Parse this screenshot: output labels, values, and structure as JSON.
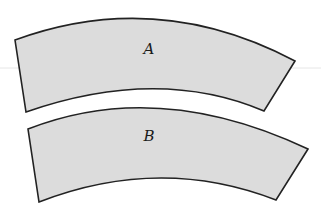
{
  "diagram": {
    "type": "annular-sector-pieces",
    "colors": {
      "fill": "#dcdcdc",
      "stroke": "#222222",
      "background": "#ffffff"
    },
    "shapes": [
      {
        "id": "A",
        "label": "A",
        "label_pos": [
          149,
          54
        ],
        "path": "M15,40 Q157,-12 295,61 L264,111 Q158,66 26,112 Z"
      },
      {
        "id": "B",
        "label": "B",
        "label_pos": [
          149,
          141
        ],
        "path": "M28,129 Q158,78 308,149 L276,200 Q160,155 39,202 Z"
      }
    ]
  }
}
